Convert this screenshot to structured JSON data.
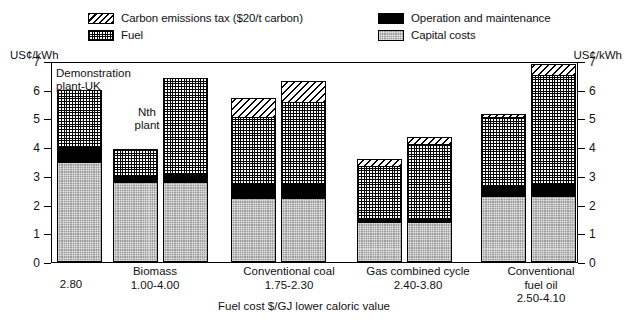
{
  "axis": {
    "unit_left": "US¢/kWh",
    "unit_right": "US¢/kWh",
    "ticks": [
      "7",
      "6",
      "5",
      "4",
      "3",
      "2",
      "1",
      "0"
    ]
  },
  "legend": {
    "items": [
      {
        "key": "tax",
        "label": "Carbon emissions tax ($20/t carbon)"
      },
      {
        "key": "fuel",
        "label": "Fuel"
      },
      {
        "key": "om",
        "label": "Operation and maintenance"
      },
      {
        "key": "cap",
        "label": "Capital costs"
      }
    ]
  },
  "annotations": [
    {
      "text": "Demonstration\nplant-UK"
    },
    {
      "text": "Nth\nplant"
    }
  ],
  "xlabel": "Fuel cost $/GJ lower caloric value",
  "groups": [
    {
      "name": "",
      "value": "2.80"
    },
    {
      "name": "Biomass",
      "value": "1.00-4.00"
    },
    {
      "name": "Conventional coal",
      "value": "1.75-2.30"
    },
    {
      "name": "Gas combined cycle",
      "value": "2.40-3.80"
    },
    {
      "name": "Conventional\nfuel oil",
      "value": "2.50-4.10"
    }
  ],
  "chart_data": {
    "type": "bar",
    "title": "",
    "subtitle": "",
    "xlabel": "Fuel cost $/GJ lower caloric value",
    "ylabel": "US¢/kWh",
    "ylim": [
      0,
      7
    ],
    "yticks": [
      0,
      1,
      2,
      3,
      4,
      5,
      6,
      7
    ],
    "grid": false,
    "stacked": true,
    "legend_position": "top",
    "series": [
      {
        "name": "Capital costs",
        "key": "cap",
        "values": [
          3.45,
          2.75,
          2.75,
          2.2,
          2.2,
          1.35,
          1.35,
          2.25,
          2.25
        ]
      },
      {
        "name": "Operation and maintenance",
        "key": "om",
        "values": [
          0.55,
          0.25,
          0.3,
          0.5,
          0.5,
          0.15,
          0.15,
          0.4,
          0.45
        ]
      },
      {
        "name": "Fuel",
        "key": "fuel",
        "values": [
          2.0,
          0.95,
          3.35,
          2.35,
          2.85,
          1.85,
          2.6,
          2.4,
          3.8
        ]
      },
      {
        "name": "Carbon emissions tax ($20/t carbon)",
        "key": "tax",
        "values": [
          0.0,
          0.0,
          0.0,
          0.65,
          0.75,
          0.25,
          0.25,
          0.1,
          0.4
        ]
      }
    ],
    "bars": [
      {
        "group": "Biomass",
        "annotation": "Demonstration plant-UK",
        "total": 6.0
      },
      {
        "group": "Biomass",
        "annotation": "Nth plant",
        "total": 3.95
      },
      {
        "group": "Biomass",
        "annotation": "",
        "total": 6.4
      },
      {
        "group": "Conventional coal",
        "annotation": "",
        "total": 5.7
      },
      {
        "group": "Conventional coal",
        "annotation": "",
        "total": 6.3
      },
      {
        "group": "Gas combined cycle",
        "annotation": "",
        "total": 3.6
      },
      {
        "group": "Gas combined cycle",
        "annotation": "",
        "total": 4.35
      },
      {
        "group": "Conventional fuel oil",
        "annotation": "",
        "total": 5.15
      },
      {
        "group": "Conventional fuel oil",
        "annotation": "",
        "total": 6.9
      }
    ],
    "group_fuel_costs": {
      "Biomass (demonstration)": "2.80",
      "Biomass": "1.00-4.00",
      "Conventional coal": "1.75-2.30",
      "Gas combined cycle": "2.40-3.80",
      "Conventional fuel oil": "2.50-4.10"
    }
  }
}
